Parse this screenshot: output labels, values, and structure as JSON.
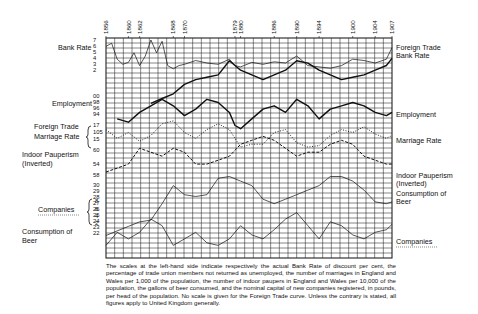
{
  "chart_data": {
    "type": "line",
    "title": "",
    "x_years_labeled": [
      "1856",
      "1860",
      "1862",
      "1868",
      "1870",
      "1879",
      "1880",
      "1886",
      "1890",
      "1894",
      "1900",
      "1904",
      "1907"
    ],
    "x_range": [
      1856,
      1907
    ],
    "grid": true,
    "left_labels": [
      {
        "text": "Bank Rate",
        "ticks": [
          "7",
          "6",
          "5",
          "4",
          "3",
          "2"
        ]
      },
      {
        "text": "Employment",
        "ticks": [
          "00",
          "98",
          "96",
          "94"
        ]
      },
      {
        "text": "Foreign Trade",
        "ticks": [
          "17"
        ]
      },
      {
        "text": "Marriage Rate",
        "ticks": [
          "105",
          "15"
        ]
      },
      {
        "text": "Indoor Pauperism",
        "ticks": [
          "60",
          "54",
          "58"
        ]
      },
      {
        "text": "(Inverted)",
        "ticks": []
      },
      {
        "text": "Companies",
        "ticks": [
          "8",
          "6",
          "4",
          "2"
        ]
      },
      {
        "text": "Consumption of",
        "ticks": []
      },
      {
        "text": "Beer",
        "ticks": [
          "30",
          "29",
          "28",
          "27",
          "26",
          "25",
          "24",
          "23",
          "22"
        ]
      }
    ],
    "right_labels": [
      "Foreign Trade",
      "Bank Rate",
      "Employment",
      "Marriage Rate",
      "Indoor Pauperism",
      "(Inverted)",
      "Consumption of",
      "Beer",
      "Companies"
    ],
    "series": [
      {
        "name": "Bank Rate",
        "style": "thin solid",
        "x": [
          1856,
          1857,
          1858,
          1859,
          1860,
          1861,
          1862,
          1863,
          1864,
          1865,
          1866,
          1867,
          1868,
          1869,
          1870,
          1872,
          1874,
          1876,
          1878,
          1879,
          1880,
          1882,
          1884,
          1886,
          1888,
          1890,
          1892,
          1894,
          1896,
          1898,
          1900,
          1902,
          1904,
          1906,
          1907
        ],
        "values": [
          6,
          6.5,
          4,
          3.2,
          3.5,
          5,
          3,
          4.5,
          7,
          5,
          6.8,
          3,
          2.5,
          3,
          3.2,
          3.8,
          3.4,
          3.2,
          4,
          3,
          2.8,
          3.5,
          3.2,
          3.6,
          3.4,
          4.5,
          3,
          2.8,
          2.6,
          3,
          4,
          3.8,
          3.4,
          4,
          5.8
        ]
      },
      {
        "name": "Foreign Trade",
        "style": "thick solid",
        "x": [
          1856,
          1858,
          1860,
          1862,
          1864,
          1866,
          1868,
          1870,
          1872,
          1874,
          1876,
          1878,
          1879,
          1880,
          1882,
          1884,
          1886,
          1888,
          1890,
          1892,
          1894,
          1896,
          1898,
          1900,
          1902,
          1904,
          1906,
          1907
        ],
        "values": [
          null,
          null,
          null,
          null,
          1,
          2,
          3,
          5,
          6,
          6.5,
          7,
          10,
          9,
          8,
          7,
          6,
          7,
          8,
          10,
          9.5,
          8,
          7,
          6,
          6.5,
          7,
          8,
          9,
          10.5
        ]
      },
      {
        "name": "Employment",
        "style": "thick solid",
        "x": [
          1858,
          1860,
          1862,
          1864,
          1866,
          1868,
          1870,
          1872,
          1874,
          1876,
          1878,
          1879,
          1880,
          1882,
          1884,
          1886,
          1888,
          1890,
          1892,
          1894,
          1896,
          1898,
          1900,
          1902,
          1904,
          1906,
          1907
        ],
        "values": [
          95,
          94.5,
          96,
          97,
          98,
          97,
          95.5,
          96.5,
          98,
          97.5,
          96,
          94,
          93.5,
          95,
          96.5,
          97,
          96,
          98,
          97,
          95,
          96.5,
          97,
          97.5,
          97,
          96,
          95.5,
          96
        ]
      },
      {
        "name": "Marriage Rate",
        "style": "dotted",
        "x": [
          1856,
          1858,
          1860,
          1862,
          1864,
          1866,
          1868,
          1870,
          1872,
          1874,
          1876,
          1878,
          1880,
          1882,
          1884,
          1886,
          1888,
          1890,
          1892,
          1894,
          1896,
          1898,
          1900,
          1902,
          1904,
          1906,
          1907
        ],
        "values": [
          16.8,
          16.2,
          16.6,
          16.0,
          16.4,
          17.2,
          17.4,
          16.6,
          16.2,
          16.8,
          17.2,
          16.8,
          15.6,
          15.8,
          15.8,
          16.6,
          16.8,
          15.9,
          15.6,
          15.7,
          16.4,
          16.8,
          16.6,
          17.0,
          16.5,
          16.2,
          16.4
        ]
      },
      {
        "name": "Indoor Pauperism (Inverted)",
        "style": "dashed",
        "x": [
          1856,
          1858,
          1860,
          1862,
          1864,
          1866,
          1868,
          1870,
          1872,
          1874,
          1876,
          1878,
          1880,
          1882,
          1884,
          1886,
          1888,
          1890,
          1892,
          1894,
          1896,
          1898,
          1900,
          1902,
          1904,
          1906,
          1907
        ],
        "values": [
          54,
          54.5,
          55,
          57,
          56.5,
          56,
          57,
          56.5,
          55,
          55,
          55.5,
          56,
          57.5,
          58,
          58.5,
          58,
          57,
          56,
          56.5,
          56.5,
          57.5,
          58,
          57.5,
          56,
          55.5,
          55,
          55
        ]
      },
      {
        "name": "Consumption of Beer",
        "style": "thin solid",
        "x": [
          1856,
          1858,
          1860,
          1862,
          1864,
          1866,
          1868,
          1870,
          1872,
          1874,
          1876,
          1878,
          1880,
          1882,
          1884,
          1886,
          1888,
          1890,
          1892,
          1894,
          1896,
          1898,
          1900,
          1902,
          1904,
          1906,
          1907
        ],
        "values": [
          22.5,
          23,
          23.5,
          24,
          24.2,
          26,
          28,
          27,
          26.8,
          27,
          28.8,
          29,
          28.5,
          28,
          26.5,
          26,
          26.5,
          27,
          27.5,
          28,
          29,
          29,
          28.5,
          27.5,
          26.2,
          26,
          26.2
        ]
      },
      {
        "name": "Companies",
        "style": "thin solid",
        "x": [
          1856,
          1858,
          1860,
          1862,
          1864,
          1866,
          1868,
          1870,
          1872,
          1874,
          1876,
          1878,
          1880,
          1882,
          1884,
          1886,
          1888,
          1890,
          1892,
          1894,
          1896,
          1898,
          1900,
          1902,
          1904,
          1906,
          1907
        ],
        "values": [
          2,
          3,
          2.5,
          3,
          4,
          3.5,
          2,
          2.5,
          3,
          2.2,
          2,
          2.5,
          3.5,
          2.8,
          2.5,
          3.2,
          4,
          4.5,
          3.5,
          2.5,
          3.8,
          3.5,
          2.8,
          2.5,
          3,
          3.2,
          3.6
        ]
      }
    ]
  },
  "caption": "The scales at the left-hand side indicate respectively the actual Bank Rate of discount per cent, the percentage of trade union members not returned as unemployed, the number of marriages in England and Wales per 1,000 of the population, the number of indoor paupers in England and Wales per 10,000 of the population, the gallons of beer consumed, and the nominal capital of new companies registered, in pounds, per head of the population. No scale is given for the Foreign Trade curve. Unless the contrary is stated, all figures apply to United Kingdom generally.",
  "colors": {
    "ink": "#111111",
    "grid": "#222222",
    "background": "#ffffff"
  }
}
